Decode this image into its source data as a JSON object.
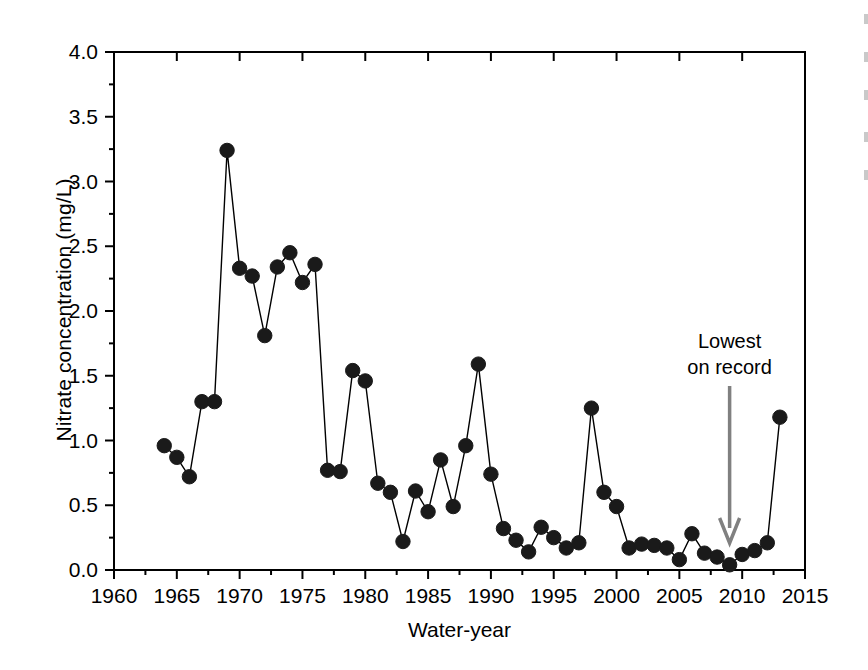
{
  "figure": {
    "background_color": "#ffffff",
    "line_color": "#000000",
    "marker_color": "#1a1a1a",
    "annotation_arrow_color": "#808080"
  },
  "axes": {
    "y_title": "Nitrate concentration (mg/L)",
    "x_title": "Water-year",
    "y_ticks": [
      "0.0",
      "0.5",
      "1.0",
      "1.5",
      "2.0",
      "2.5",
      "3.0",
      "3.5",
      "4.0"
    ],
    "x_ticks": [
      "1960",
      "1965",
      "1970",
      "1975",
      "1980",
      "1985",
      "1990",
      "1995",
      "2000",
      "2005",
      "2010",
      "2015"
    ]
  },
  "annotations": [
    {
      "name": "lowest-on-record",
      "line1": "Lowest",
      "line2": "on record",
      "points_to_year": 2009,
      "arrow_color": "#808080"
    }
  ],
  "chart_data": {
    "type": "line",
    "title": "",
    "subtitle": "",
    "xlabel": "Water-year",
    "ylabel": "Nitrate concentration (mg/L)",
    "xlim": [
      1960,
      2015
    ],
    "ylim": [
      0.0,
      4.0
    ],
    "x_tick_step": 5,
    "x_minor_tick_step": 2.5,
    "y_tick_step": 0.5,
    "grid": false,
    "legend": "none",
    "marker": "filled-circle",
    "series": [
      {
        "name": "Nitrate concentration",
        "x": [
          1964,
          1965,
          1966,
          1967,
          1968,
          1969,
          1970,
          1971,
          1972,
          1973,
          1974,
          1975,
          1976,
          1977,
          1978,
          1979,
          1980,
          1981,
          1982,
          1983,
          1984,
          1985,
          1986,
          1987,
          1988,
          1989,
          1990,
          1991,
          1992,
          1993,
          1994,
          1995,
          1996,
          1997,
          1998,
          1999,
          2000,
          2001,
          2002,
          2003,
          2004,
          2005,
          2006,
          2007,
          2008,
          2009,
          2010,
          2011,
          2012,
          2013
        ],
        "values": [
          0.96,
          0.87,
          0.72,
          1.3,
          1.3,
          3.24,
          2.33,
          2.27,
          1.81,
          2.34,
          2.45,
          2.22,
          2.36,
          0.77,
          0.76,
          1.54,
          1.46,
          0.67,
          0.6,
          0.22,
          0.61,
          0.45,
          0.85,
          0.49,
          0.96,
          1.59,
          0.74,
          0.32,
          0.23,
          0.14,
          0.33,
          0.25,
          0.17,
          0.21,
          1.25,
          0.6,
          0.49,
          0.17,
          0.2,
          0.19,
          0.17,
          0.08,
          0.28,
          0.13,
          0.1,
          0.04,
          0.12,
          0.15,
          0.21,
          1.18
        ]
      }
    ],
    "extrema": {
      "max_value": 3.24,
      "max_year": 1969,
      "min_value": 0.04,
      "min_year": 2009
    }
  }
}
